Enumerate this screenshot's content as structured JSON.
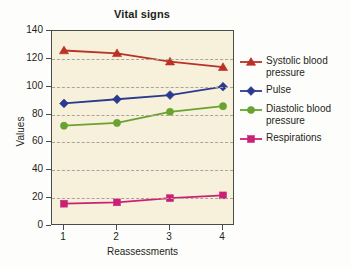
{
  "chart_data": {
    "type": "line",
    "title": "Vital signs",
    "xlabel": "Reassessments",
    "ylabel": "Values",
    "categories": [
      "1",
      "2",
      "3",
      "4"
    ],
    "x": [
      1,
      2,
      3,
      4
    ],
    "ylim": [
      0,
      140
    ],
    "ytick_values": [
      0,
      20,
      40,
      60,
      80,
      100,
      120,
      140
    ],
    "ytick_labels": [
      "0",
      "20",
      "40",
      "60",
      "80",
      "100",
      "120",
      "140"
    ],
    "grid": "horizontal-dashed",
    "legend_position": "right",
    "plot_background": "#f7f1dc",
    "series": [
      {
        "name": "Systolic blood pressure",
        "values": [
          126,
          124,
          118,
          114
        ],
        "color": "#b93225",
        "marker": "triangle"
      },
      {
        "name": "Pulse",
        "values": [
          88,
          91,
          94,
          100
        ],
        "color": "#2b3a8f",
        "marker": "diamond"
      },
      {
        "name": "Diastolic blood pressure",
        "values": [
          72,
          74,
          82,
          86
        ],
        "color": "#6aa230",
        "marker": "circle"
      },
      {
        "name": "Respirations",
        "values": [
          16,
          17,
          20,
          22
        ],
        "color": "#cc2077",
        "marker": "square"
      }
    ]
  }
}
